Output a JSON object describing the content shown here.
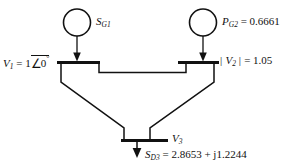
{
  "diagram": {
    "type": "one-line-diagram",
    "stroke_color": "#111111",
    "background_color": "#ffffff",
    "buses": [
      {
        "id": "bus1",
        "bus_label": "V_1 = 1 angle 0 deg",
        "voltage_symbol": "V",
        "voltage_subscript": "1",
        "voltage_equals": "= 1",
        "angle_symbol": "∠",
        "angle_value": "0",
        "degree_symbol": "°"
      },
      {
        "id": "bus2",
        "bus_label": "| V_2 | = 1.05",
        "bar_left": "|",
        "voltage_symbol": "V",
        "voltage_subscript": "2",
        "bar_right": "|",
        "voltage_equals": "= 1.05"
      },
      {
        "id": "bus3",
        "voltage_symbol": "V",
        "voltage_subscript": "3"
      }
    ],
    "generators": [
      {
        "id": "gen1",
        "symbol": "S",
        "subscript": "G1",
        "value": ""
      },
      {
        "id": "gen2",
        "symbol": "P",
        "subscript": "G2",
        "value": "= 0.6661"
      }
    ],
    "load": {
      "id": "load3",
      "symbol": "S",
      "subscript": "D3",
      "value": "=  2.8653  +  j1.2244"
    }
  }
}
